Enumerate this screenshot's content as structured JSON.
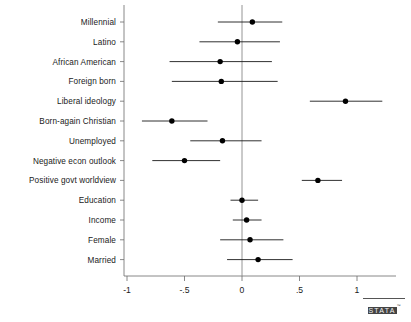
{
  "chart_data": {
    "type": "scatter",
    "title": "",
    "subtitle": "",
    "xlabel": "",
    "ylabel": "",
    "xlim": [
      -1.15,
      1.3
    ],
    "grid": false,
    "legend": null,
    "orientation": "horizontal",
    "style": "coefficient plot with 95% confidence intervals",
    "xticks": [
      -1,
      -0.5,
      0,
      0.5,
      1
    ],
    "xtick_labels": [
      "-1",
      "-.5",
      "0",
      ".5",
      "1"
    ],
    "reference_line": 0,
    "categories": [
      "Millennial",
      "Latino",
      "African American",
      "Foreign born",
      "Liberal ideology",
      "Born-again Christian",
      "Unemployed",
      "Negative econ outlook",
      "Positive govt worldview",
      "Education",
      "Income",
      "Female",
      "Married"
    ],
    "points": [
      {
        "label": "Millennial",
        "estimate": 0.09,
        "ci_low": -0.21,
        "ci_high": 0.35
      },
      {
        "label": "Latino",
        "estimate": -0.04,
        "ci_low": -0.37,
        "ci_high": 0.33
      },
      {
        "label": "African American",
        "estimate": -0.19,
        "ci_low": -0.63,
        "ci_high": 0.26
      },
      {
        "label": "Foreign born",
        "estimate": -0.18,
        "ci_low": -0.61,
        "ci_high": 0.31
      },
      {
        "label": "Liberal ideology",
        "estimate": 0.9,
        "ci_low": 0.59,
        "ci_high": 1.22
      },
      {
        "label": "Born-again Christian",
        "estimate": -0.61,
        "ci_low": -0.87,
        "ci_high": -0.3
      },
      {
        "label": "Unemployed",
        "estimate": -0.17,
        "ci_low": -0.45,
        "ci_high": 0.17
      },
      {
        "label": "Negative econ outlook",
        "estimate": -0.5,
        "ci_low": -0.78,
        "ci_high": -0.19
      },
      {
        "label": "Positive govt worldview",
        "estimate": 0.66,
        "ci_low": 0.52,
        "ci_high": 0.87
      },
      {
        "label": "Education",
        "estimate": 0.0,
        "ci_low": -0.1,
        "ci_high": 0.14
      },
      {
        "label": "Income",
        "estimate": 0.04,
        "ci_low": -0.08,
        "ci_high": 0.17
      },
      {
        "label": "Female",
        "estimate": 0.07,
        "ci_low": -0.19,
        "ci_high": 0.36
      },
      {
        "label": "Married",
        "estimate": 0.14,
        "ci_low": -0.13,
        "ci_high": 0.44
      }
    ]
  },
  "branding": {
    "logo_text": "STATA",
    "logo_tm": "™"
  }
}
